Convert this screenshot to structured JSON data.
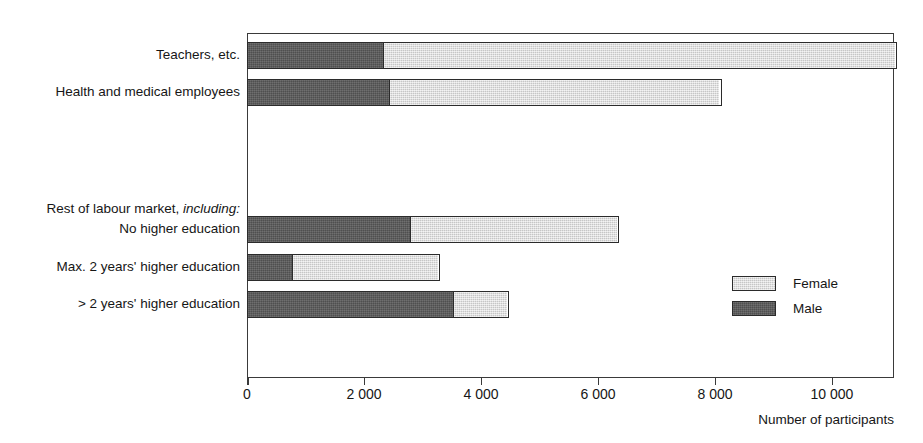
{
  "chart_data": {
    "type": "bar",
    "orientation": "horizontal",
    "stacked": true,
    "title": "",
    "xlabel": "Number of participants",
    "ylabel": "",
    "xlim": [
      0,
      11060
    ],
    "xticks": [
      0,
      2000,
      4000,
      6000,
      8000,
      10000
    ],
    "xticklabels": [
      "0",
      "2 000",
      "4 000",
      "6 000",
      "8 000",
      "10 000"
    ],
    "grid": false,
    "legend_position": "right-inside",
    "categories": [
      "Teachers, etc.",
      "Health and medical employees",
      "Rest of labour market, including:",
      "No higher education",
      "Max. 2 years' higher education",
      "> 2 years' higher education"
    ],
    "group_header_index": 2,
    "series": [
      {
        "name": "Male",
        "color": "#575757",
        "values": [
          2320,
          2420,
          null,
          2780,
          770,
          3520
        ]
      },
      {
        "name": "Female",
        "color": "#dcdcdc",
        "values": [
          8740,
          5640,
          null,
          3530,
          2470,
          910
        ]
      }
    ],
    "totals": [
      11060,
      8060,
      null,
      6310,
      3240,
      4430
    ]
  },
  "legend": {
    "items": [
      {
        "label": "Female",
        "swatch": "female-swatch"
      },
      {
        "label": "Male",
        "swatch": "male-swatch"
      }
    ]
  },
  "axis": {
    "title": "Number of participants",
    "tick_labels": [
      "0",
      "2 000",
      "4 000",
      "6 000",
      "8 000",
      "10 000"
    ]
  },
  "labels": {
    "teachers": "Teachers, etc.",
    "health": "Health and medical employees",
    "rest_prefix": "Rest of labour market, ",
    "rest_italic": "including:",
    "no_higher": "No higher education",
    "max_two": "Max. 2 years' higher education",
    "gt_two": "> 2 years' higher education"
  }
}
